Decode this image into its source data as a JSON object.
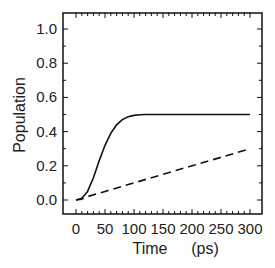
{
  "chart_data": {
    "type": "line",
    "title": "",
    "xlabel": "Time",
    "xlabel_unit": "(ps)",
    "ylabel": "Population",
    "xlim": [
      -15,
      315
    ],
    "ylim": [
      -0.1,
      1.1
    ],
    "x_ticks": [
      0,
      50,
      100,
      150,
      200,
      250,
      300
    ],
    "x_tick_labels": [
      "0",
      "50",
      "100",
      "150",
      "200",
      "250",
      "300"
    ],
    "y_ticks": [
      0.0,
      0.2,
      0.4,
      0.6,
      0.8,
      1.0
    ],
    "y_tick_labels": [
      "0.0",
      "0.2",
      "0.4",
      "0.6",
      "0.8",
      "1.0"
    ],
    "grid": false,
    "legend": null,
    "series": [
      {
        "name": "solid",
        "style": "solid",
        "color": "#111111",
        "x": [
          0,
          10,
          20,
          30,
          40,
          50,
          60,
          70,
          80,
          90,
          100,
          110,
          120,
          140,
          160,
          200,
          250,
          300
        ],
        "y": [
          0.0,
          0.01,
          0.05,
          0.13,
          0.23,
          0.32,
          0.39,
          0.44,
          0.47,
          0.487,
          0.495,
          0.498,
          0.5,
          0.5,
          0.5,
          0.5,
          0.5,
          0.5
        ]
      },
      {
        "name": "dashed",
        "style": "dashed",
        "color": "#111111",
        "x": [
          0,
          10,
          20,
          50,
          100,
          150,
          200,
          250,
          300
        ],
        "y": [
          0.0,
          0.005,
          0.02,
          0.05,
          0.1,
          0.15,
          0.2,
          0.25,
          0.3
        ]
      }
    ]
  }
}
